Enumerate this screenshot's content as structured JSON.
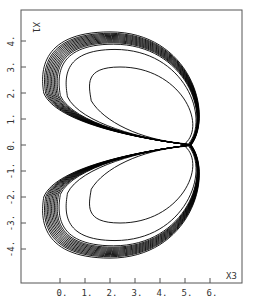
{
  "chart_data": {
    "type": "line",
    "title": "",
    "xlabel": "X3",
    "ylabel": "X1",
    "xlim": [
      -1.6,
      7.3
    ],
    "ylim": [
      -5.3,
      5.2
    ],
    "x_ticks": [
      "0.",
      "1.",
      "2.",
      "3.",
      "4.",
      "5.",
      "6."
    ],
    "x_tick_values": [
      0,
      1,
      2,
      3,
      4,
      5,
      6
    ],
    "y_ticks": [
      "4.",
      "3.",
      "2.",
      "1.",
      "0.",
      "-1.",
      "-2.",
      "-3.",
      "-4."
    ],
    "y_tick_values": [
      4,
      3,
      2,
      1,
      0,
      -1,
      -2,
      -3,
      -4
    ],
    "grid": false,
    "legend": null,
    "series": [
      {
        "name": "trajectory",
        "lobes": [
          {
            "center_x3": 2.6,
            "center_x1": 2.6,
            "outer_extent_x3": [
              -0.7,
              6.3
            ],
            "outer_extent_x1": [
              0.0,
              4.3
            ],
            "inner_extent_x3": [
              1.0,
              5.0
            ],
            "inner_extent_x1": [
              0.3,
              3.0
            ]
          },
          {
            "center_x3": 2.6,
            "center_x1": -2.6,
            "outer_extent_x3": [
              -0.8,
              6.4
            ],
            "outer_extent_x1": [
              -4.6,
              0.0
            ],
            "inner_extent_x3": [
              1.2,
              5.2
            ],
            "inner_extent_x1": [
              -3.9,
              -0.3
            ]
          }
        ]
      }
    ]
  }
}
